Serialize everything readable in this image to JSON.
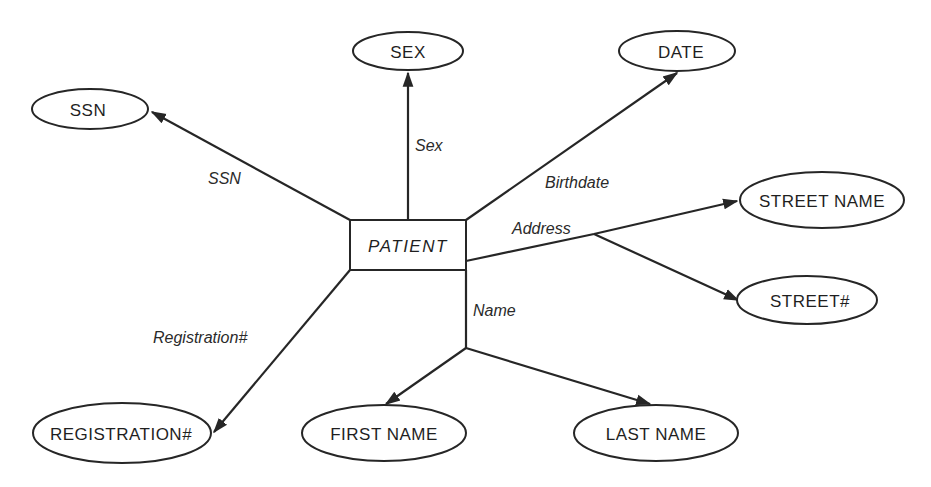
{
  "diagram": {
    "type": "entity-attribute-diagram",
    "entity": {
      "label": "PATIENT"
    },
    "attributes": {
      "ssn": "SSN",
      "sex": "SEX",
      "date": "DATE",
      "street_name": "STREET NAME",
      "street_no": "STREET#",
      "first_name": "FIRST NAME",
      "last_name": "LAST NAME",
      "registration": "REGISTRATION#"
    },
    "edges": {
      "ssn": "SSN",
      "sex": "Sex",
      "birthdate": "Birthdate",
      "address": "Address",
      "name": "Name",
      "registration": "Registration#"
    },
    "relations": [
      {
        "from": "PATIENT",
        "label": "SSN",
        "to": "SSN"
      },
      {
        "from": "PATIENT",
        "label": "Sex",
        "to": "SEX"
      },
      {
        "from": "PATIENT",
        "label": "Birthdate",
        "to": "DATE"
      },
      {
        "from": "PATIENT",
        "label": "Address",
        "to": [
          "STREET NAME",
          "STREET#"
        ]
      },
      {
        "from": "PATIENT",
        "label": "Name",
        "to": [
          "FIRST NAME",
          "LAST NAME"
        ]
      },
      {
        "from": "PATIENT",
        "label": "Registration#",
        "to": "REGISTRATION#"
      }
    ]
  }
}
